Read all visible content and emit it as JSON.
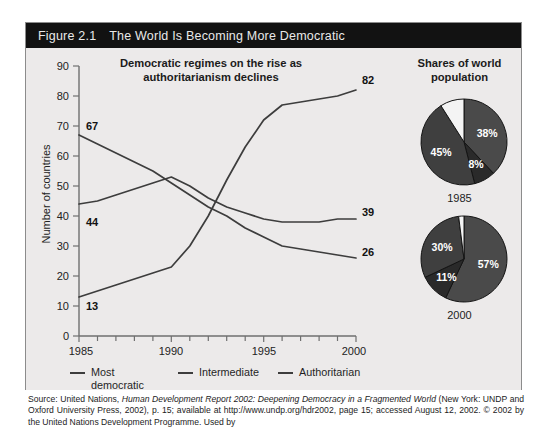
{
  "figure": {
    "number": "Figure 2.1",
    "title": "The World Is Becoming More Democratic",
    "header_bg": "#121212",
    "header_fg": "#e9e9e9",
    "panel_bg": "#eceaea",
    "border_color": "#8c8c8c"
  },
  "chart_data": [
    {
      "type": "line",
      "title": "Democratic regimes on the rise as authoritarianism declines",
      "xlabel": "",
      "ylabel": "Number of countries",
      "ylim": [
        0,
        90
      ],
      "ytick_step": 10,
      "yticks": [
        "0",
        "10",
        "20",
        "30",
        "40",
        "50",
        "60",
        "70",
        "80",
        "90"
      ],
      "xlim": [
        1985,
        2000
      ],
      "x": [
        1985,
        1986,
        1987,
        1988,
        1989,
        1990,
        1991,
        1992,
        1993,
        1994,
        1995,
        1996,
        1997,
        1998,
        1999,
        2000
      ],
      "xticks_labeled": [
        "1985",
        "1990",
        "1995",
        "2000"
      ],
      "grid": false,
      "series": [
        {
          "name": "Most democratic",
          "color": "#3d3d3d",
          "start_label": "13",
          "end_label": "82",
          "values": [
            13,
            15,
            17,
            19,
            21,
            23,
            30,
            40,
            52,
            63,
            72,
            77,
            78,
            79,
            80,
            82
          ]
        },
        {
          "name": "Intermediate",
          "color": "#3d3d3d",
          "start_label": "44",
          "end_label": "39",
          "values": [
            44,
            45,
            47,
            49,
            51,
            53,
            50,
            46,
            43,
            41,
            39,
            38,
            38,
            38,
            39,
            39
          ]
        },
        {
          "name": "Authoritarian",
          "color": "#3d3d3d",
          "start_label": "67",
          "end_label": "26",
          "values": [
            67,
            64,
            61,
            58,
            55,
            51,
            47,
            43,
            40,
            36,
            33,
            30,
            29,
            28,
            27,
            26
          ]
        }
      ]
    },
    {
      "type": "pie",
      "title": "Shares of world population",
      "year": "1985",
      "labels": [
        "38%",
        "8%",
        "45%",
        ""
      ],
      "values": [
        38,
        8,
        45,
        9
      ],
      "colors": [
        "#4a4a4a",
        "#2a2a2a",
        "#3f3f3f",
        "#f4f4f4"
      ],
      "start_angle": 0
    },
    {
      "type": "pie",
      "title": "Shares of world population",
      "year": "2000",
      "labels": [
        "57%",
        "11%",
        "30%",
        ""
      ],
      "values": [
        57,
        11,
        30,
        2
      ],
      "colors": [
        "#4a4a4a",
        "#2a2a2a",
        "#3f3f3f",
        "#f4f4f4"
      ],
      "start_angle": 0
    }
  ],
  "pies_section": {
    "title_line1": "Shares of world",
    "title_line2": "population",
    "year_1985": "1985",
    "year_2000": "2000"
  },
  "line_chart": {
    "title_line1": "Democratic regimes on the rise as",
    "title_line2": "authoritarianism declines",
    "ylabel": "Number of countries",
    "ytick_0": "0",
    "ytick_10": "10",
    "ytick_20": "20",
    "ytick_30": "30",
    "ytick_40": "40",
    "ytick_50": "50",
    "ytick_60": "60",
    "ytick_70": "70",
    "ytick_80": "80",
    "ytick_90": "90",
    "xtick_1985": "1985",
    "xtick_1990": "1990",
    "xtick_1995": "1995",
    "xtick_2000": "2000",
    "label_67": "67",
    "label_44": "44",
    "label_13": "13",
    "label_82": "82",
    "label_39": "39",
    "label_26": "26"
  },
  "legend": {
    "items": [
      {
        "label_line1": "Most",
        "label_line2": "democratic",
        "color": "#3d3d3d"
      },
      {
        "label_line1": "Intermediate",
        "label_line2": "",
        "color": "#3d3d3d"
      },
      {
        "label_line1": "Authoritarian",
        "label_line2": "",
        "color": "#3d3d3d"
      }
    ]
  },
  "source": {
    "prefix": "Source: United Nations, ",
    "italic_title": "Human Development Report 2002: Deepening Democracy in a Fragmented World",
    "rest": " (New York: UNDP and Oxford University Press, 2002), p. 15; available at http://www.undp.org/hdr2002, page 15; accessed August 12, 2002. © 2002 by the United Nations Development Programme. Used by"
  }
}
